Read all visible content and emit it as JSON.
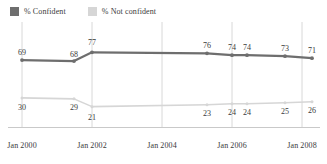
{
  "legend": {
    "position": "top-left",
    "items": [
      {
        "label": "% Confident",
        "color": "#6e6e6e",
        "swatch_name": "legend-swatch-confident"
      },
      {
        "label": "% Not confident",
        "color": "#d6d6d6",
        "swatch_name": "legend-swatch-not-confident"
      }
    ]
  },
  "axis": {
    "ticks": [
      {
        "label": "Jan 2000",
        "x": 22
      },
      {
        "label": "Jan 2002",
        "x": 92
      },
      {
        "label": "Jan 2004",
        "x": 162
      },
      {
        "label": "Jan 2006",
        "x": 232
      },
      {
        "label": "Jan 2008",
        "x": 302
      }
    ]
  },
  "chart_data": {
    "type": "line",
    "title": "",
    "xlabel": "",
    "ylabel": "",
    "ylim": [
      0,
      100
    ],
    "grid": "vertical",
    "legend_position": "top-left",
    "x_tick_labels": [
      "Jan 2000",
      "Jan 2002",
      "Jan 2004",
      "Jan 2006",
      "Jan 2008"
    ],
    "x_positions_px": [
      22,
      74,
      92,
      207,
      232,
      247,
      285,
      312
    ],
    "series": [
      {
        "name": "% Confident",
        "color": "#6e6e6e",
        "values": [
          69,
          68,
          77,
          76,
          74,
          74,
          73,
          71
        ],
        "labels": [
          "69",
          "68",
          "77",
          "76",
          "74",
          "74",
          "73",
          "71"
        ],
        "label_side": "above"
      },
      {
        "name": "% Not confident",
        "color": "#d6d6d6",
        "values": [
          30,
          29,
          21,
          23,
          24,
          24,
          25,
          26
        ],
        "labels": [
          "30",
          "29",
          "21",
          "23",
          "24",
          "24",
          "25",
          "26"
        ],
        "label_side": "below"
      }
    ]
  }
}
